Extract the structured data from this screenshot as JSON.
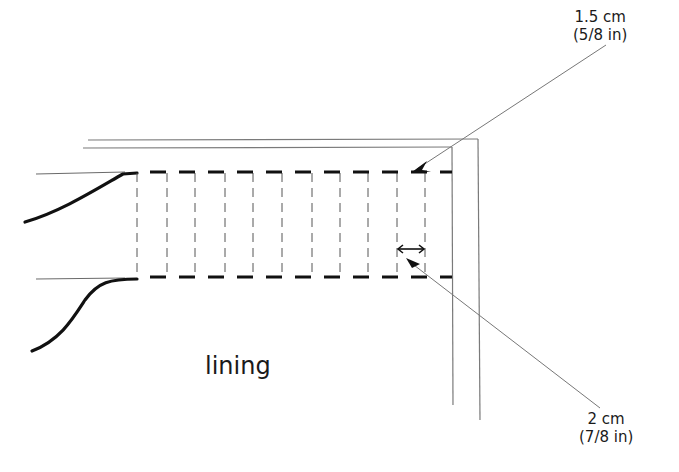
{
  "diagram": {
    "type": "sewing-technical-sketch",
    "region_label": "lining",
    "annotations": [
      {
        "id": "seam-allowance-width",
        "metric": "1.5 cm",
        "imperial": "(5/8 in)",
        "points_to": "top dashed stitching line"
      },
      {
        "id": "stitch-spacing",
        "metric": "2 cm",
        "imperial": "(7/8 in)",
        "points_to": "spacing between vertical dashed lines"
      }
    ],
    "vertical_dashed_line_count": 11,
    "colors": {
      "ink": "#111111",
      "thin_line": "#777777",
      "background": "#ffffff"
    }
  }
}
